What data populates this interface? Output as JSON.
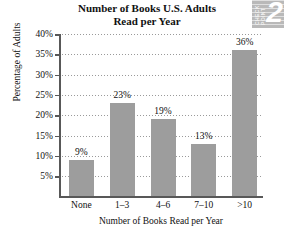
{
  "chart_data": {
    "type": "bar",
    "title": "Number of Books U.S. Adults Read per Year",
    "title_line1": "Number of Books U.S. Adults",
    "title_line2": "Read per Year",
    "xlabel": "Number of Books Read per Year",
    "ylabel": "Percentage of Adults",
    "categories": [
      "None",
      "1–3",
      "4–6",
      "7–10",
      ">10"
    ],
    "values": [
      9,
      23,
      19,
      13,
      36
    ],
    "value_labels": [
      "9%",
      "23%",
      "19%",
      "13%",
      "36%"
    ],
    "ylim": [
      0,
      40
    ],
    "ytick_values": [
      5,
      10,
      15,
      20,
      25,
      30,
      35,
      40
    ],
    "ytick_labels": [
      "5%",
      "10%",
      "15%",
      "20%",
      "25%",
      "30%",
      "35%",
      "40%"
    ],
    "grid": "horizontal-dotted",
    "legend": "none",
    "bar_color": "#9d9d9d",
    "axis_color": "#585858",
    "gridline_color": "#9a9a9a",
    "text_color": "#111111"
  },
  "badge": {
    "word1": "CHECK",
    "word2": "POINT",
    "number": "2",
    "background": "#b9b9b9"
  }
}
